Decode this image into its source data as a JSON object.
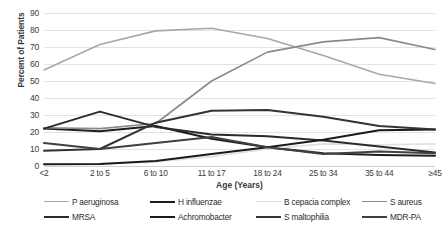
{
  "chart_data": {
    "type": "line",
    "title": "",
    "xlabel": "Age (Years)",
    "ylabel": "Percent of Patients",
    "categories": [
      "<2",
      "2 to 5",
      "6 to 10",
      "11 to 17",
      "18 to 24",
      "25 to 34",
      "35 to 44",
      "≥45"
    ],
    "ylim": [
      0,
      90
    ],
    "yticks": [
      0,
      10,
      20,
      30,
      40,
      50,
      60,
      70,
      80,
      90
    ],
    "grid": true,
    "legend_position": "bottom",
    "series": [
      {
        "name": "P aeruginosa",
        "color": "#a8a8a8",
        "width": 1.6,
        "values": [
          56.5,
          71.5,
          79.5,
          81.0,
          75.0,
          65.0,
          54.0,
          48.5
        ]
      },
      {
        "name": "H influenzae",
        "color": "#1e1e1e",
        "width": 2.0,
        "values": [
          22.0,
          20.5,
          23.5,
          16.0,
          11.0,
          7.5,
          6.5,
          6.0
        ]
      },
      {
        "name": "B cepacia complex",
        "color": "#e0e0e0",
        "width": 1.6,
        "values": [
          1.0,
          1.2,
          2.5,
          5.5,
          10.0,
          13.0,
          12.5,
          13.0
        ]
      },
      {
        "name": "S aureus",
        "color": "#8a8a8a",
        "width": 1.6,
        "values": [
          22.5,
          22.0,
          25.0,
          50.0,
          67.0,
          73.0,
          75.5,
          68.5
        ]
      },
      {
        "name": "MRSA",
        "color": "#2b2b2b",
        "width": 2.0,
        "values": [
          22.0,
          32.0,
          23.0,
          18.5,
          17.5,
          15.0,
          11.5,
          8.0
        ]
      },
      {
        "name": "Achromobacter",
        "color": "#1a1a1a",
        "width": 2.0,
        "values": [
          1.0,
          1.2,
          3.0,
          7.0,
          11.0,
          15.5,
          21.0,
          21.5
        ]
      },
      {
        "name": "S maltophilia",
        "color": "#333333",
        "width": 2.0,
        "values": [
          9.0,
          10.0,
          25.5,
          32.5,
          33.0,
          29.0,
          23.5,
          21.5
        ]
      },
      {
        "name": "MDR-PA",
        "color": "#404040",
        "width": 2.0,
        "values": [
          13.5,
          10.0,
          13.5,
          17.0,
          11.0,
          7.0,
          8.5,
          7.5
        ]
      }
    ]
  },
  "legend": {
    "row1": [
      "P aeruginosa",
      "H influenzae",
      "B cepacia complex",
      "S aureus"
    ],
    "row2": [
      "MRSA",
      "Achromobacter",
      "S maltophilia",
      "MDR-PA"
    ]
  },
  "axis": {
    "y_title": "Percent of Patients",
    "x_title": "Age (Years)"
  }
}
